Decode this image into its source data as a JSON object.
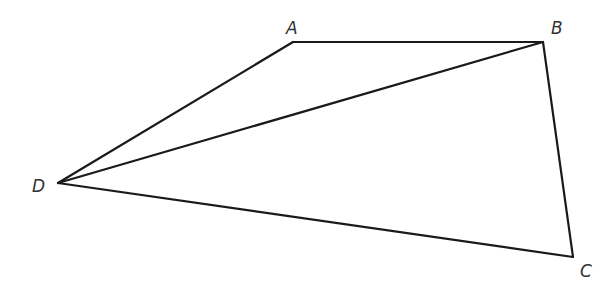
{
  "figure": {
    "type": "quadrilateral-with-diagonal",
    "vertices": [
      {
        "id": "A",
        "label": "A",
        "x": 293,
        "y": 42,
        "label_x": 286,
        "label_y": 20
      },
      {
        "id": "B",
        "label": "B",
        "x": 543,
        "y": 42,
        "label_x": 551,
        "label_y": 20
      },
      {
        "id": "C",
        "label": "C",
        "x": 573,
        "y": 257,
        "label_x": 580,
        "label_y": 263
      },
      {
        "id": "D",
        "label": "D",
        "x": 58,
        "y": 183,
        "label_x": 32,
        "label_y": 178
      }
    ],
    "edges": [
      [
        "A",
        "B"
      ],
      [
        "B",
        "C"
      ],
      [
        "C",
        "D"
      ],
      [
        "D",
        "A"
      ],
      [
        "D",
        "B"
      ]
    ],
    "stroke_color": "#1a1a1a"
  }
}
